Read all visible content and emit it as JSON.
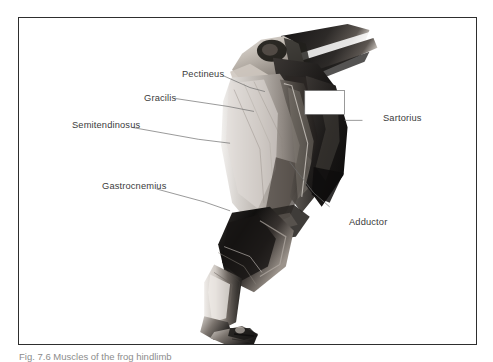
{
  "figure": {
    "frame_border_color": "#2e2e2e",
    "background_color": "#ffffff",
    "label_text_color": "#3b3b3b",
    "leader_line_color": "#6e6e6e",
    "callout_box_fill": "#ffffff"
  },
  "labels": {
    "pectineus": "Pectineus",
    "gracilis": "Gracilis",
    "semitendinosus": "Semitendinosus",
    "gastrocnemius": "Gastrocnemius",
    "sartorius": "Sartorius",
    "adductor": "Adductor"
  },
  "caption": {
    "text": "Fig. 7.6  Muscles of the frog hindlimb"
  }
}
